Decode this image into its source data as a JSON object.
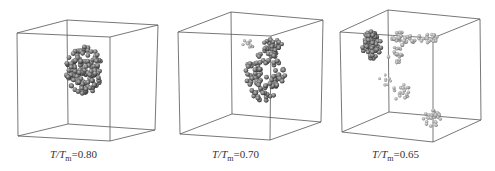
{
  "figure": {
    "panels": [
      {
        "id": "a",
        "ratio_label": "T/T",
        "sub": "m",
        "value": "=0.80",
        "caption_x": 50,
        "state": "compact single cluster near cube center"
      },
      {
        "id": "b",
        "ratio_label": "T/T",
        "sub": "m",
        "value": "=0.70",
        "caption_x": 212,
        "state": "fragmented cluster with hole plus small group near top"
      },
      {
        "id": "c",
        "ratio_label": "T/T",
        "sub": "m",
        "value": "=0.65",
        "caption_x": 372,
        "state": "multiple dispersed small clusters"
      }
    ],
    "colors": {
      "edge": "#555555",
      "atom_dark": "#444444",
      "atom_mid": "#7a7a7a",
      "atom_light": "#b5b5b5"
    }
  }
}
